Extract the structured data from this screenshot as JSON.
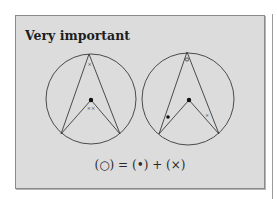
{
  "box": {
    "title": "Very important",
    "formula": "(○) = (•) + (×)",
    "background": "#dcdcdc",
    "border": "#8a8a8a"
  },
  "diagrams": [
    {
      "name": "left-circle",
      "description": "Inscribed angle and central angle subtending the same arc",
      "labels": {
        "inscribed_angle": "×",
        "central_angle": "××"
      }
    },
    {
      "name": "right-circle",
      "description": "Inscribed angle split into two parts via center",
      "labels": {
        "inscribed_angle": "○",
        "left_base_angle": "•",
        "right_base_angle": "×"
      }
    }
  ]
}
